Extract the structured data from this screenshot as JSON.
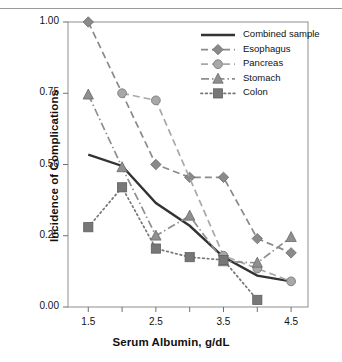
{
  "figure": {
    "header_faint_text": "",
    "background_color": "#ffffff"
  },
  "chart_data": {
    "type": "line",
    "title": "",
    "xlabel": "Serum Albumin, g/dL",
    "ylabel": "Incidence of Complications",
    "x": [
      1.5,
      2.0,
      2.5,
      3.0,
      3.5,
      4.0,
      4.5
    ],
    "xlim": [
      1.2,
      4.75
    ],
    "ylim": [
      0.0,
      1.0
    ],
    "xticks": [
      1.5,
      2.0,
      2.5,
      3.0,
      3.5,
      4.0,
      4.5
    ],
    "xtick_labels": [
      "1.5",
      "",
      "2.5",
      "",
      "3.5",
      "",
      "4.5"
    ],
    "yticks": [
      0.0,
      0.25,
      0.5,
      0.75,
      1.0
    ],
    "ytick_labels": [
      "0.00",
      "0.25",
      "0.50",
      "0.75",
      "1.00"
    ],
    "grid": false,
    "legend_position": "top-right",
    "series": [
      {
        "name": "Combined sample",
        "style": "solid",
        "marker": "none",
        "color": "#333333",
        "x": [
          1.5,
          2.0,
          2.5,
          3.0,
          3.5,
          4.0,
          4.5
        ],
        "values": [
          0.535,
          0.495,
          0.365,
          0.285,
          0.175,
          0.11,
          0.09
        ]
      },
      {
        "name": "Esophagus",
        "style": "dashed",
        "marker": "diamond",
        "color": "#8a8a8a",
        "x": [
          1.5,
          2.5,
          3.0,
          3.5,
          4.0,
          4.5
        ],
        "values": [
          1.0,
          0.5,
          0.455,
          0.455,
          0.24,
          0.19
        ]
      },
      {
        "name": "Pancreas",
        "style": "dashed-light",
        "marker": "circle",
        "color": "#a8a8a8",
        "x": [
          2.0,
          2.5,
          3.5,
          4.0,
          4.5
        ],
        "values": [
          0.75,
          0.725,
          0.18,
          0.135,
          0.09
        ]
      },
      {
        "name": "Stomach",
        "style": "dash-dot",
        "marker": "triangle",
        "color": "#8f8f8f",
        "x": [
          1.5,
          2.0,
          2.5,
          3.0,
          3.5,
          4.0,
          4.5
        ],
        "values": [
          0.745,
          0.49,
          0.25,
          0.32,
          0.16,
          0.155,
          0.245
        ]
      },
      {
        "name": "Colon",
        "style": "dotted",
        "marker": "square",
        "color": "#777777",
        "x": [
          1.5,
          2.0,
          2.5,
          3.0,
          3.5,
          4.0
        ],
        "values": [
          0.28,
          0.42,
          0.205,
          0.175,
          0.165,
          0.025
        ]
      }
    ]
  },
  "legend": {
    "items": [
      {
        "label": "Combined sample"
      },
      {
        "label": "Esophagus"
      },
      {
        "label": "Pancreas"
      },
      {
        "label": "Stomach"
      },
      {
        "label": "Colon"
      }
    ]
  }
}
